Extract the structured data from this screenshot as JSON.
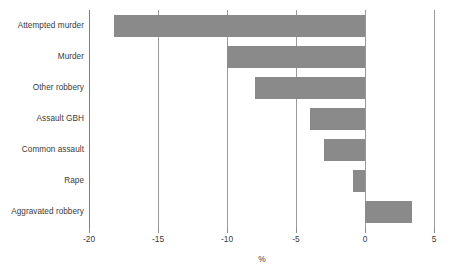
{
  "chart_data": {
    "type": "bar",
    "orientation": "horizontal",
    "title": "",
    "subtitle": "",
    "xlabel": "%",
    "ylabel": "",
    "categories": [
      "Attempted murder",
      "Murder",
      "Other robbery",
      "Assault GBH",
      "Common assault",
      "Rape",
      "Aggravated robbery"
    ],
    "values": [
      -18.2,
      -10.0,
      -8.0,
      -4.0,
      -3.0,
      -0.9,
      3.4
    ],
    "series": [
      {
        "name": "Percentage change",
        "values": [
          -18.2,
          -10.0,
          -8.0,
          -4.0,
          -3.0,
          -0.9,
          3.4
        ]
      }
    ],
    "xlim": [
      -20,
      5
    ],
    "xticks": [
      -20,
      -15,
      -10,
      -5,
      0,
      5
    ],
    "xtick_labels": [
      "-20",
      "-15",
      "-10",
      "-5",
      "0",
      "5"
    ],
    "grid": "vertical",
    "legend": "none",
    "bar_color": "#8a8a8a",
    "gridline_color": "#9a9a9a",
    "text_color": "#3a3a3a",
    "background": "#ffffff"
  }
}
